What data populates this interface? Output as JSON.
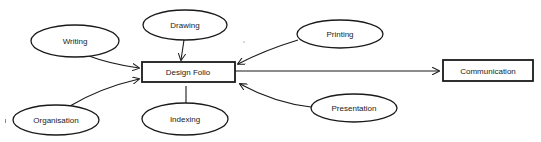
{
  "diagram": {
    "type": "concept-map",
    "center_node": {
      "id": "design-folio",
      "label": "Design Folio",
      "shape": "rectangle"
    },
    "output_node": {
      "id": "communication",
      "label": "Communication",
      "shape": "rectangle"
    },
    "input_nodes": [
      {
        "id": "writing",
        "label": "Writing",
        "shape": "ellipse"
      },
      {
        "id": "drawing",
        "label": "Drawing",
        "shape": "ellipse"
      },
      {
        "id": "printing",
        "label": "Printing",
        "shape": "ellipse"
      },
      {
        "id": "organisation",
        "label": "Organisation",
        "shape": "ellipse"
      },
      {
        "id": "indexing",
        "label": "Indexing",
        "shape": "ellipse"
      },
      {
        "id": "presentation",
        "label": "Presentation",
        "shape": "ellipse"
      }
    ],
    "edges": [
      {
        "from": "writing",
        "to": "design-folio",
        "arrow": true
      },
      {
        "from": "drawing",
        "to": "design-folio",
        "arrow": true
      },
      {
        "from": "printing",
        "to": "design-folio",
        "arrow": true
      },
      {
        "from": "organisation",
        "to": "design-folio",
        "arrow": true
      },
      {
        "from": "indexing",
        "to": "design-folio",
        "arrow": false
      },
      {
        "from": "presentation",
        "to": "design-folio",
        "arrow": true
      },
      {
        "from": "design-folio",
        "to": "communication",
        "arrow": true
      }
    ],
    "colors": {
      "stroke": "#1a1a1a",
      "fill": "#ffffff",
      "text": "#222222"
    }
  }
}
